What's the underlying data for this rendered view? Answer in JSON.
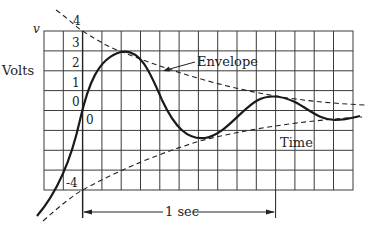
{
  "diagram": {
    "y_axis": {
      "symbol": "v",
      "label": "Volts",
      "ticks": [
        "4",
        "3",
        "2",
        "1",
        "0",
        "-4"
      ]
    },
    "origin_label": "0",
    "annotations": {
      "envelope": "Envelope",
      "time": "Time",
      "duration": "1 sec"
    },
    "grid": {
      "columns": 16,
      "rows": 8
    },
    "colors": {
      "line": "#1a1a1a",
      "grid": "#333333",
      "background": "#ffffff"
    }
  }
}
